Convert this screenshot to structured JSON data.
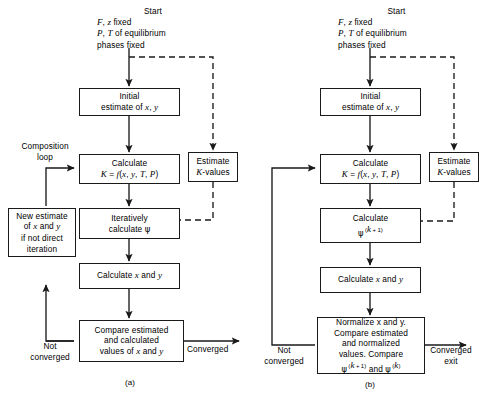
{
  "figure": {
    "type": "flowchart",
    "caption_a": "(a)",
    "caption_b": "(b)"
  },
  "panel_a": {
    "start": {
      "line1": "Start",
      "line2": "F, z fixed",
      "line3": "P, T of equilibrium",
      "line4": "phases fixed"
    },
    "boxes": {
      "initial_estimate": "Initial\nestimate of x, y",
      "initial_estimate_l1": "Initial",
      "initial_estimate_l2": "estimate of x, y",
      "calculate_k_l1": "Calculate",
      "calculate_k_l2": "K = f(x, y, T, P)",
      "estimate_k_values_l1": "Estimate",
      "estimate_k_values_l2": "K-values",
      "iteratively_l1": "Iteratively",
      "iteratively_l2": "calculate ψ",
      "calculate_xy": "Calculate x and y",
      "compare_l1": "Compare estimated",
      "compare_l2": "and calculated",
      "compare_l3": "values of x and y",
      "new_estimate_l1": "New estimate",
      "new_estimate_l2": "of x and y",
      "new_estimate_l3": "if not direct",
      "new_estimate_l4": "iteration"
    },
    "labels": {
      "composition_loop_l1": "Composition",
      "composition_loop_l2": "loop",
      "not_converged_l1": "Not",
      "not_converged_l2": "converged",
      "converged": "Converged"
    }
  },
  "panel_b": {
    "start": {
      "line1": "Start",
      "line2": "F, z fixed",
      "line3": "P, T of equilibrium",
      "line4": "phases fixed"
    },
    "boxes": {
      "initial_estimate_l1": "Initial",
      "initial_estimate_l2": "estimate of x, y",
      "calculate_k_l1": "Calculate",
      "calculate_k_l2": "K = f(x, y, T, P)",
      "estimate_k_values_l1": "Estimate",
      "estimate_k_values_l2": "K-values",
      "calculate_psi_l1": "Calculate",
      "calculate_psi_l2": "ψ (k + 1)",
      "calculate_xy": "Calculate x and y",
      "normalize_l1": "Normalize x and y.",
      "normalize_l2": "Compare estimated",
      "normalize_l3": "and normalized",
      "normalize_l4": "values. Compare",
      "normalize_l5": "ψ (k + 1) and ψ (k)"
    },
    "labels": {
      "not_converged_l1": "Not",
      "not_converged_l2": "converged",
      "converged_l1": "Converged",
      "converged_l2": "exit"
    }
  },
  "colors": {
    "stroke": "#1a1a1a",
    "background": "#ffffff"
  }
}
